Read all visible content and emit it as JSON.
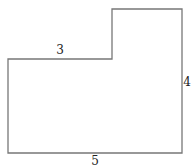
{
  "diagram": {
    "shape": "L-shaped polygon (rectilinear)",
    "stroke_color": "#777777",
    "background": "#ffffff",
    "vertices": [
      [
        8,
        59
      ],
      [
        112,
        59
      ],
      [
        112,
        9
      ],
      [
        182,
        9
      ],
      [
        182,
        153
      ],
      [
        8,
        153
      ]
    ],
    "labels": [
      {
        "id": "top-left-edge",
        "text": "3",
        "x": 60,
        "y": 54
      },
      {
        "id": "right-edge",
        "text": "4",
        "x": 187,
        "y": 86
      },
      {
        "id": "bottom-edge",
        "text": "5",
        "x": 95,
        "y": 165
      }
    ]
  }
}
